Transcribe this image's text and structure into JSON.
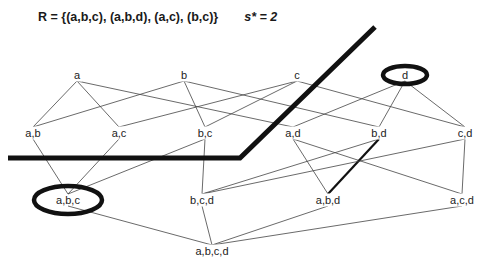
{
  "title": {
    "relation": "R = {(a,b,c), (a,b,d), (a,c), (b,c)}",
    "support": "s* = 2"
  },
  "colors": {
    "edge": "#444444",
    "border": "#111111",
    "highlight_ring": "#111111",
    "text": "#222222"
  },
  "nodes": [
    {
      "id": "a",
      "label": "a",
      "level": 1,
      "x": 77,
      "y": 75,
      "circled": false
    },
    {
      "id": "b",
      "label": "b",
      "level": 1,
      "x": 184,
      "y": 75,
      "circled": false
    },
    {
      "id": "c",
      "label": "c",
      "level": 1,
      "x": 297,
      "y": 75,
      "circled": false
    },
    {
      "id": "d",
      "label": "d",
      "level": 1,
      "x": 405,
      "y": 75,
      "circled": true
    },
    {
      "id": "ab",
      "label": "a,b",
      "level": 2,
      "x": 33,
      "y": 133,
      "circled": false
    },
    {
      "id": "ac",
      "label": "a,c",
      "level": 2,
      "x": 119,
      "y": 133,
      "circled": false
    },
    {
      "id": "bc",
      "label": "b,c",
      "level": 2,
      "x": 205,
      "y": 133,
      "circled": false
    },
    {
      "id": "ad",
      "label": "a,d",
      "level": 2,
      "x": 293,
      "y": 133,
      "circled": false
    },
    {
      "id": "bd",
      "label": "b,d",
      "level": 2,
      "x": 379,
      "y": 133,
      "circled": false
    },
    {
      "id": "cd",
      "label": "c,d",
      "level": 2,
      "x": 465,
      "y": 133,
      "circled": false
    },
    {
      "id": "abc",
      "label": "a,b,c",
      "level": 3,
      "x": 68,
      "y": 200,
      "circled": true
    },
    {
      "id": "bcd",
      "label": "b,c,d",
      "level": 3,
      "x": 202,
      "y": 200,
      "circled": false
    },
    {
      "id": "abd",
      "label": "a,b,d",
      "level": 3,
      "x": 328,
      "y": 200,
      "circled": false
    },
    {
      "id": "acd",
      "label": "a,c,d",
      "level": 3,
      "x": 462,
      "y": 200,
      "circled": false
    },
    {
      "id": "abcd",
      "label": "a,b,c,d",
      "level": 4,
      "x": 212,
      "y": 251,
      "circled": false
    }
  ],
  "edges": [
    {
      "from": "a",
      "to": "ab",
      "thick": false
    },
    {
      "from": "a",
      "to": "ac",
      "thick": false
    },
    {
      "from": "a",
      "to": "ad",
      "thick": false
    },
    {
      "from": "b",
      "to": "ab",
      "thick": false
    },
    {
      "from": "b",
      "to": "bc",
      "thick": false
    },
    {
      "from": "b",
      "to": "bd",
      "thick": false
    },
    {
      "from": "c",
      "to": "ac",
      "thick": false
    },
    {
      "from": "c",
      "to": "bc",
      "thick": false
    },
    {
      "from": "c",
      "to": "cd",
      "thick": false
    },
    {
      "from": "d",
      "to": "ad",
      "thick": false
    },
    {
      "from": "d",
      "to": "bd",
      "thick": false
    },
    {
      "from": "d",
      "to": "cd",
      "thick": false
    },
    {
      "from": "ab",
      "to": "abc",
      "thick": false
    },
    {
      "from": "ac",
      "to": "abc",
      "thick": false
    },
    {
      "from": "bc",
      "to": "abc",
      "thick": false
    },
    {
      "from": "bc",
      "to": "bcd",
      "thick": false
    },
    {
      "from": "ad",
      "to": "abd",
      "thick": false
    },
    {
      "from": "ad",
      "to": "acd",
      "thick": false
    },
    {
      "from": "bd",
      "to": "bcd",
      "thick": false
    },
    {
      "from": "bd",
      "to": "abd",
      "thick": true
    },
    {
      "from": "cd",
      "to": "bcd",
      "thick": false
    },
    {
      "from": "cd",
      "to": "acd",
      "thick": false
    },
    {
      "from": "abc",
      "to": "abcd",
      "thick": false
    },
    {
      "from": "bcd",
      "to": "abcd",
      "thick": false
    },
    {
      "from": "abd",
      "to": "abcd",
      "thick": false
    },
    {
      "from": "acd",
      "to": "abcd",
      "thick": false
    }
  ],
  "border": {
    "points": [
      [
        8,
        158
      ],
      [
        240,
        158
      ],
      [
        375,
        27
      ]
    ],
    "width": 5
  },
  "rings": [
    {
      "node": "d",
      "cx": 405,
      "cy": 75,
      "rx": 22,
      "ry": 9
    },
    {
      "node": "abc",
      "cx": 68,
      "cy": 200,
      "rx": 34,
      "ry": 14
    }
  ]
}
